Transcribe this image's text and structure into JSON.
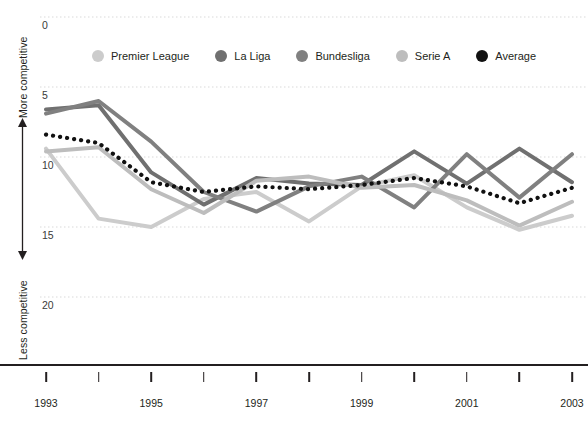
{
  "axes": {
    "y_label_top": "More competitive",
    "y_label_bottom": "Less competitive",
    "y_ticks": [
      "0",
      "5",
      "10",
      "15",
      "20"
    ],
    "x_ticks": [
      "1993",
      "",
      "1995",
      "",
      "1997",
      "",
      "1999",
      "",
      "2001",
      "",
      "2003"
    ]
  },
  "legend": {
    "items": [
      {
        "label": "Premier League",
        "color": "#cccccc"
      },
      {
        "label": "La Liga",
        "color": "#707070"
      },
      {
        "label": "Bundesliga",
        "color": "#808080"
      },
      {
        "label": "Serie A",
        "color": "#bdbdbd"
      },
      {
        "label": "Average",
        "color": "#111111"
      }
    ]
  },
  "chart_data": {
    "type": "line",
    "title": "",
    "xlabel": "",
    "ylabel": "",
    "xlim": [
      1993,
      2003
    ],
    "ylim": [
      0,
      21.5
    ],
    "y_inverted": true,
    "grid": true,
    "legend_position": "top",
    "x": [
      1993,
      1994,
      1995,
      1996,
      1997,
      1998,
      1999,
      2000,
      2001,
      2002,
      2003
    ],
    "series": [
      {
        "name": "Premier League",
        "color": "#cccccc",
        "style": "solid",
        "values": [
          9.4,
          14.4,
          15.0,
          13.0,
          12.5,
          14.6,
          12.1,
          11.3,
          13.6,
          15.2,
          14.2
        ]
      },
      {
        "name": "La Liga",
        "color": "#707070",
        "style": "solid",
        "values": [
          6.6,
          6.3,
          11.1,
          13.4,
          11.5,
          11.9,
          12.0,
          9.6,
          11.9,
          9.4,
          11.8
        ]
      },
      {
        "name": "Bundesliga",
        "color": "#808080",
        "style": "solid",
        "values": [
          6.9,
          6.0,
          8.9,
          12.5,
          13.9,
          12.1,
          11.4,
          13.6,
          9.8,
          12.9,
          9.8
        ]
      },
      {
        "name": "Serie A",
        "color": "#bdbdbd",
        "style": "solid",
        "values": [
          9.6,
          9.3,
          12.3,
          14.0,
          11.7,
          11.4,
          12.2,
          12.0,
          13.1,
          14.9,
          13.2
        ]
      },
      {
        "name": "Average",
        "color": "#111111",
        "style": "dotted",
        "values": [
          8.4,
          9.0,
          11.8,
          12.5,
          12.1,
          12.3,
          12.0,
          11.5,
          12.1,
          13.3,
          12.2
        ]
      }
    ]
  }
}
